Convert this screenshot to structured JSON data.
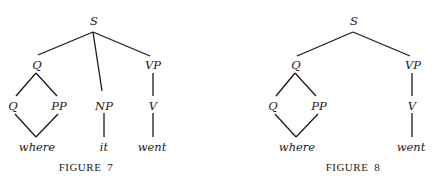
{
  "figures": [
    {
      "caption": "Figure 7",
      "caption_label": "FIGURE",
      "caption_num": "7",
      "nodes": {
        "s": "S",
        "q_top": "Q",
        "vp": "VP",
        "q_low": "Q",
        "pp": "PP",
        "np": "NP",
        "v": "V",
        "where": "where",
        "it": "it",
        "went": "went"
      }
    },
    {
      "caption": "Figure 8",
      "caption_label": "FIGURE",
      "caption_num": "8",
      "nodes": {
        "s": "S",
        "q_top": "Q",
        "vp": "VP",
        "q_low": "Q",
        "pp": "PP",
        "v": "V",
        "where": "where",
        "went": "went"
      }
    }
  ]
}
